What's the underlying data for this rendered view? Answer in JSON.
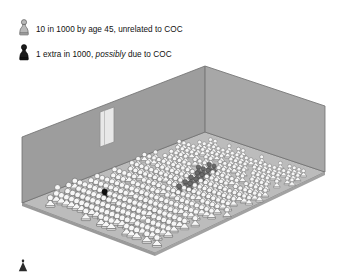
{
  "figure": {
    "type": "isometric-pictogram",
    "background_color": "#ffffff"
  },
  "legend": {
    "items": [
      {
        "id": "baseline",
        "icon": "light-pawn-figure-icon",
        "icon_color": "#b5b5b5",
        "label_text": "10 in 1000 by age 45, unrelated to COC",
        "label_parts": [
          {
            "text": "10 in 1000 by age 45, unrelated to COC",
            "style": "normal"
          }
        ]
      },
      {
        "id": "extra",
        "icon": "dark-pawn-figure-icon",
        "icon_color": "#1a1a1a",
        "label_parts": [
          {
            "text": "1 extra in 1000, ",
            "style": "normal"
          },
          {
            "text": "possibly",
            "style": "italic"
          },
          {
            "text": " due to COC",
            "style": "normal"
          }
        ],
        "label_text": "1 extra in 1000, possibly due to COC"
      }
    ]
  },
  "room": {
    "wall_color": "#9e9e9e",
    "wall_color_right": "#a8a8a8",
    "floor_color": "#bdbdbd",
    "outline_color": "#6e6e6e",
    "door": {
      "name": "door",
      "fill": "#e6e6e6",
      "frame": "#8a8a8a"
    }
  },
  "chart_data": {
    "type": "pictogram",
    "unit_label": "person",
    "total_units": 1000,
    "categories": [
      "Baseline cases unrelated to COC",
      "Extra case possibly due to COC",
      "Women without cancer"
    ],
    "values": [
      10,
      1,
      989
    ],
    "colors": [
      "#6b6b6b",
      "#1a1a1a",
      "#f2f2f2"
    ],
    "notes": [
      "10 in 1000 by age 45, unrelated to COC",
      "1 extra in 1000, possibly due to COC"
    ]
  },
  "crowd": {
    "figure_fill": "#f7f7f7",
    "figure_stroke": "#5a5a5a",
    "highlight_fill": "#6b6b6b",
    "highlight_stroke": "#3d3d3d",
    "single_fill": "#111111",
    "single_stroke": "#000000",
    "highlight_count": 10,
    "single_count": 1
  }
}
